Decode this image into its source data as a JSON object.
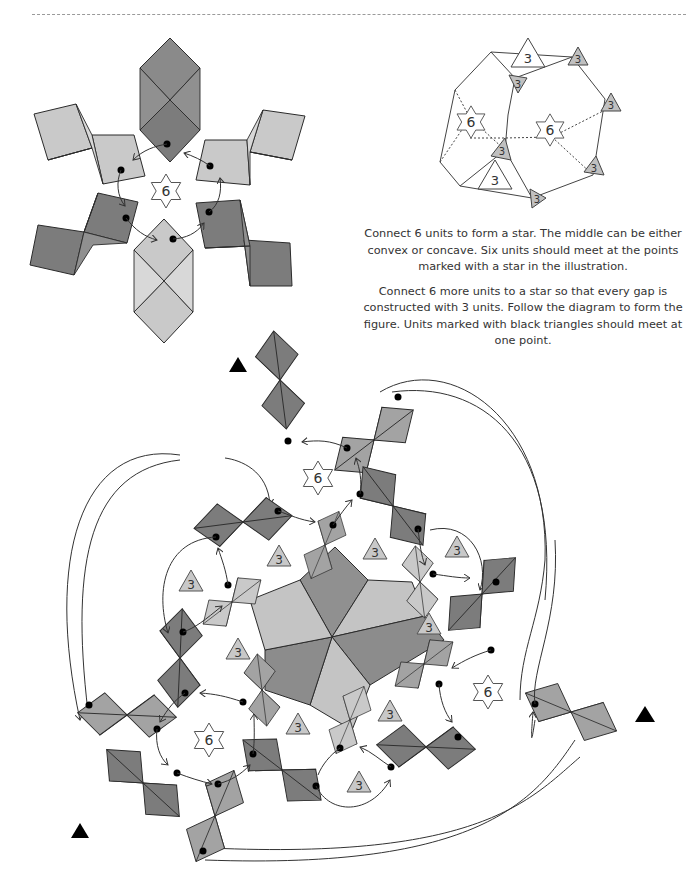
{
  "colors": {
    "dark_unit": "#7c7c7c",
    "dark_unit_flap": "#909090",
    "mid_unit": "#a3a3a3",
    "mid_unit_flap": "#b6b6b6",
    "light_unit": "#c9c9c9",
    "light_unit_flap": "#d8d8d8",
    "outline": "#2b2b2b",
    "badge_three_fill": "#c8c8c8",
    "text": "#333333"
  },
  "instructions": {
    "paragraph_1": "Connect 6 units to form a star. The middle can be either convex or concave. Six units should meet at the points marked with a star in the illustration.",
    "paragraph_2": "Connect 6 more units to a star so that every gap is constructed with 3 units. Follow the diagram to form the figure. Units marked with black triangles should meet at one point."
  },
  "figure_star_assembly": {
    "center_badge": "6",
    "units": [
      {
        "x": 175,
        "y": 90,
        "rot": 90,
        "tone": "dark"
      },
      {
        "x": 82,
        "y": 135,
        "rot": 150,
        "tone": "light"
      },
      {
        "x": 268,
        "y": 138,
        "rot": 30,
        "tone": "light"
      },
      {
        "x": 78,
        "y": 232,
        "rot": 210,
        "tone": "dark"
      },
      {
        "x": 268,
        "y": 232,
        "rot": -30,
        "tone": "dark"
      },
      {
        "x": 164,
        "y": 280,
        "rot": 270,
        "tone": "light"
      }
    ]
  },
  "figure_polyhedron": {
    "star_badges": [
      "6",
      "6"
    ],
    "three_badges_outlined": [
      "3",
      "3"
    ],
    "three_badges_shaded": [
      "3",
      "3",
      "3",
      "3",
      "3",
      "3"
    ]
  },
  "figure_full_assembly": {
    "star_badges": [
      "6",
      "6",
      "6"
    ],
    "three_badges": [
      "3",
      "3",
      "3",
      "3",
      "3",
      "3",
      "3",
      "3",
      "3"
    ],
    "black_triangle_markers": 3
  }
}
